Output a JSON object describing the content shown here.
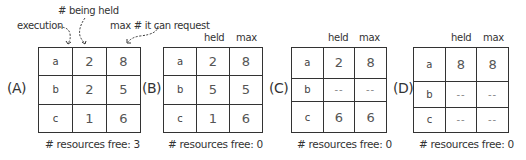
{
  "annotations": {
    "execution": "execution",
    "being_held": "# being held",
    "max_request": "max # it can request"
  },
  "column_headers": {
    "held": "held",
    "max": "max"
  },
  "panels": [
    {
      "label": "(A)",
      "rows": [
        {
          "process": "a",
          "held": "2",
          "max": "8"
        },
        {
          "process": "b",
          "held": "2",
          "max": "5"
        },
        {
          "process": "c",
          "held": "1",
          "max": "6"
        }
      ],
      "free_text": "# resources free: 3"
    },
    {
      "label": "(B)",
      "rows": [
        {
          "process": "a",
          "held": "2",
          "max": "8"
        },
        {
          "process": "b",
          "held": "5",
          "max": "5"
        },
        {
          "process": "c",
          "held": "1",
          "max": "6"
        }
      ],
      "free_text": "# resources free: 0"
    },
    {
      "label": "(C)",
      "rows": [
        {
          "process": "a",
          "held": "2",
          "max": "8"
        },
        {
          "process": "b",
          "held": "--",
          "max": "--"
        },
        {
          "process": "c",
          "held": "6",
          "max": "6"
        }
      ],
      "free_text": "# resources free: 0"
    },
    {
      "label": "(D)",
      "rows": [
        {
          "process": "a",
          "held": "8",
          "max": "8"
        },
        {
          "process": "b",
          "held": "--",
          "max": "--"
        },
        {
          "process": "c",
          "held": "--",
          "max": "--"
        }
      ],
      "free_text": "# resources free: 0"
    }
  ]
}
